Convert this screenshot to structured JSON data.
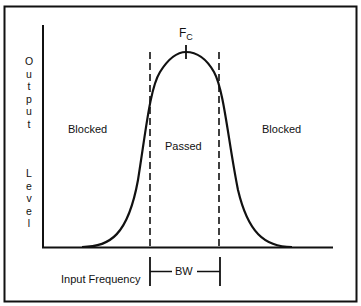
{
  "diagram": {
    "y_axis_label": "Output Level",
    "y_axis_label_top": [
      "O",
      "u",
      "t",
      "p",
      "u",
      "t"
    ],
    "y_axis_label_bottom": [
      "L",
      "e",
      "v",
      "e",
      "l"
    ],
    "x_axis_label": "Input Frequency",
    "regions": {
      "left": "Blocked",
      "center": "Passed",
      "right": "Blocked"
    },
    "center_frequency_label": "F",
    "center_frequency_subscript": "C",
    "bandwidth_label": "BW",
    "colors": {
      "background": "#ffffff",
      "ink": "#111111"
    }
  }
}
